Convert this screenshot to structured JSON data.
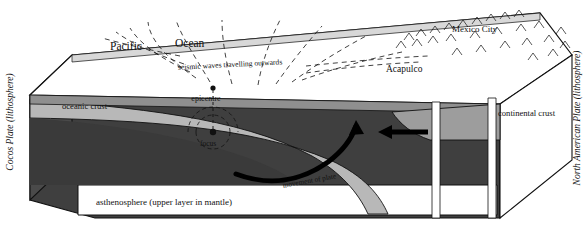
{
  "diagram": {
    "type": "block-diagram",
    "side_labels": {
      "left": "Cocos Plate (lithosphere)",
      "right": "North American Plate (lithosphere)"
    },
    "surface_labels": {
      "ocean_left": "Pacific",
      "ocean_right": "Ocean",
      "waves": "seismic waves travelling outwards",
      "city": "Mexico City",
      "port": "Acapulco"
    },
    "cross_section_labels": {
      "oceanic_crust": "oceanic crust",
      "continental_crust": "continental crust",
      "epicentre": "epicentre",
      "focus": "focus",
      "movement": "movement of plate",
      "asthenosphere": "asthenosphere (upper layer in mantle)"
    },
    "colors": {
      "outline": "#111111",
      "surface_fill": "#ffffff",
      "mantle_fill": "#3f3f3f",
      "crust_band": "#bdbdbd",
      "top_slab": "#9a9a9a",
      "arrow": "#000000"
    }
  }
}
